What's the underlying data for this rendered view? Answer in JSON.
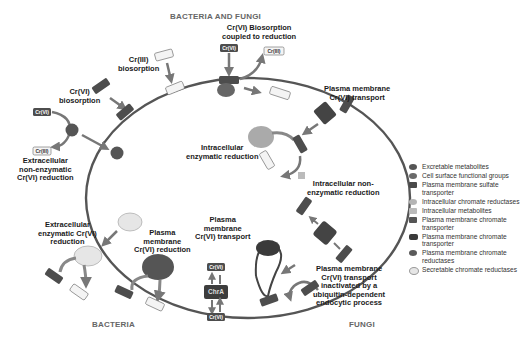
{
  "titles": {
    "top": "BACTERIA AND FUNGI",
    "bottom_left": "BACTERIA",
    "bottom_right": "FUNGI"
  },
  "labels": {
    "biosorption_coupled_1": "Cr(VI) Biosorption",
    "biosorption_coupled_2": "coupled to reduction",
    "cr3_biosorption_1": "Cr(III)",
    "cr3_biosorption_2": "biosorption",
    "cr6_biosorption_1": "Cr(VI)",
    "cr6_biosorption_2": "biosorption",
    "extra_nonenz_1": "Extracellular",
    "extra_nonenz_2": "non-enzymatic",
    "extra_nonenz_3": "Cr(VI) reduction",
    "pm_transport_top_1": "Plasma membrane",
    "pm_transport_top_2": "Cr(VI) transport",
    "intra_enz_1": "Intracellular",
    "intra_enz_2": "enzymatic reduction",
    "intra_nonenz_1": "Intracellular non-",
    "intra_nonenz_2": "enzymatic reduction",
    "extra_enz_1": "Extracellular",
    "extra_enz_2": "enzymatic Cr(VI)",
    "extra_enz_3": "reduction",
    "pm_reduction_1": "Plasma",
    "pm_reduction_2": "membrane",
    "pm_reduction_3": "Cr(VI) reduction",
    "pm_transport_bot_1": "Plasma",
    "pm_transport_bot_2": "membrane",
    "pm_transport_bot_3": "Cr(VI) transport",
    "ubiq_1": "Plasma membrane",
    "ubiq_2": "Cr(VI) transport",
    "ubiq_3": "inactivated by a",
    "ubiq_4": "ubiquitin-dependent",
    "ubiq_5": "endocytic process"
  },
  "tags": {
    "cr6": "Cr(VI)",
    "cr3": "Cr(III)",
    "chra": "ChrA",
    "sulfate": "SO4"
  },
  "legend": [
    {
      "label": "Excretable metabolites",
      "color": "#555555",
      "shape": "circle"
    },
    {
      "label": "Cell surface functional groups",
      "color": "#6a6a6a",
      "shape": "circle"
    },
    {
      "label": "Plasma membrane sulfate transporter",
      "color": "#4a4a4a",
      "shape": "square"
    },
    {
      "label": "Intracellular chromate reductases",
      "color": "#b5b5b5",
      "shape": "circle"
    },
    {
      "label": "Intracellular metabolites",
      "color": "#bbbbbb",
      "shape": "square"
    },
    {
      "label": "Plasma membrane chromate transporter",
      "color": "#555555",
      "shape": "square"
    },
    {
      "label": "Plasma membrane chromate transporter",
      "color": "#3a3a3a",
      "shape": "rect"
    },
    {
      "label": "Plasma membrane chromate reductases",
      "color": "#5a5a5a",
      "shape": "circle"
    },
    {
      "label": "Secretable chromate reductases",
      "color": "#e6e6e6",
      "shape": "circle"
    }
  ],
  "colors": {
    "membrane": "#555555",
    "dark_tag": "#4d4d4d",
    "light_tag": "#f4f4f4",
    "arrow": "#777777",
    "enzyme_light": "#d8d8d8",
    "enzyme_mid": "#aaaaaa"
  }
}
